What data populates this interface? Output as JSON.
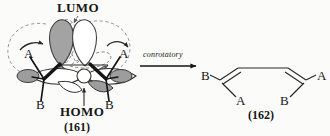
{
  "figure": {
    "type": "chemical-reaction-scheme",
    "background_color": "#fbfbfa",
    "ink_color": "#161616",
    "lobe_shaded_color": "#a3a3a3",
    "lobe_outline_color": "#4a4a4a",
    "dashed_color": "#8a8a8a"
  },
  "left_structure": {
    "name": "reactant-orbital-diagram",
    "compound_label": "(161)",
    "lumo_label": "LUMO",
    "homo_label": "HOMO",
    "substituents": [
      {
        "id": "left-a",
        "text": "A"
      },
      {
        "id": "left-b",
        "text": "B"
      },
      {
        "id": "right-a",
        "text": "A"
      },
      {
        "id": "right-b",
        "text": "B"
      }
    ]
  },
  "arrow": {
    "name": "reaction-arrow",
    "label": "conrotatory",
    "direction": "right"
  },
  "right_structure": {
    "name": "product-diene",
    "compound_label": "(162)",
    "substituents": [
      {
        "id": "d-b-left",
        "text": "B"
      },
      {
        "id": "d-a-left",
        "text": "A"
      },
      {
        "id": "d-b-right",
        "text": "B"
      },
      {
        "id": "d-a-right",
        "text": "A"
      }
    ]
  }
}
